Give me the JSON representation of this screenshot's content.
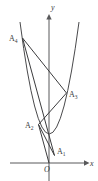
{
  "figure": {
    "background_color": "#ffffff",
    "stroke_color": "#3c3c3e",
    "axes": {
      "x_axis": {
        "label": "x",
        "label_x": 90,
        "label_y": 166,
        "line": {
          "x1": 10,
          "y1": 163,
          "x2": 84,
          "y2": 163
        },
        "arrow": "right"
      },
      "y_axis": {
        "label": "y",
        "label_x": 51,
        "label_y": 10,
        "line": {
          "x1": 49,
          "y1": 181,
          "x2": 49,
          "y2": 18
        },
        "arrow": "up"
      },
      "origin": {
        "label": "O",
        "x": 49,
        "y": 163,
        "label_x": 45,
        "label_y": 172
      }
    },
    "curve": {
      "name": "parabola",
      "vertex": {
        "x": 49,
        "y": 163
      },
      "path": "M 20 22 Q 49 246 79 22",
      "description": "upward opening parabola with vertex at origin"
    },
    "points": [
      {
        "name": "A1",
        "letter": "A",
        "sub": "1",
        "x": 54.5,
        "y": 155.5,
        "label_x": 57,
        "label_y": 154
      },
      {
        "name": "A2",
        "letter": "A",
        "sub": "2",
        "x": 38.5,
        "y": 124.5,
        "label_x": 25,
        "label_y": 128
      },
      {
        "name": "A3",
        "letter": "A",
        "sub": "3",
        "x": 66.5,
        "y": 93.0,
        "label_x": 69,
        "label_y": 97
      },
      {
        "name": "A4",
        "letter": "A",
        "sub": "4",
        "x": 22.5,
        "y": 38.0,
        "label_x": 9,
        "label_y": 41
      }
    ],
    "segments": [
      {
        "name": "A4-A3",
        "from": "A4",
        "to": "A3",
        "x1": 22.5,
        "y1": 38.0,
        "x2": 66.5,
        "y2": 93.0
      },
      {
        "name": "A4-A1",
        "from": "A4",
        "to": "A1",
        "x1": 22.5,
        "y1": 38.0,
        "x2": 54.5,
        "y2": 155.5
      },
      {
        "name": "A2-A3",
        "from": "A2",
        "to": "A3",
        "x1": 38.5,
        "y1": 124.5,
        "x2": 66.5,
        "y2": 93.0
      },
      {
        "name": "A2-A1",
        "from": "A2",
        "to": "A1",
        "x1": 38.5,
        "y1": 124.5,
        "x2": 54.5,
        "y2": 155.5
      },
      {
        "name": "A2-O",
        "from": "A2",
        "to": "O",
        "x1": 38.5,
        "y1": 124.5,
        "x2": 49.0,
        "y2": 163.0
      }
    ]
  }
}
